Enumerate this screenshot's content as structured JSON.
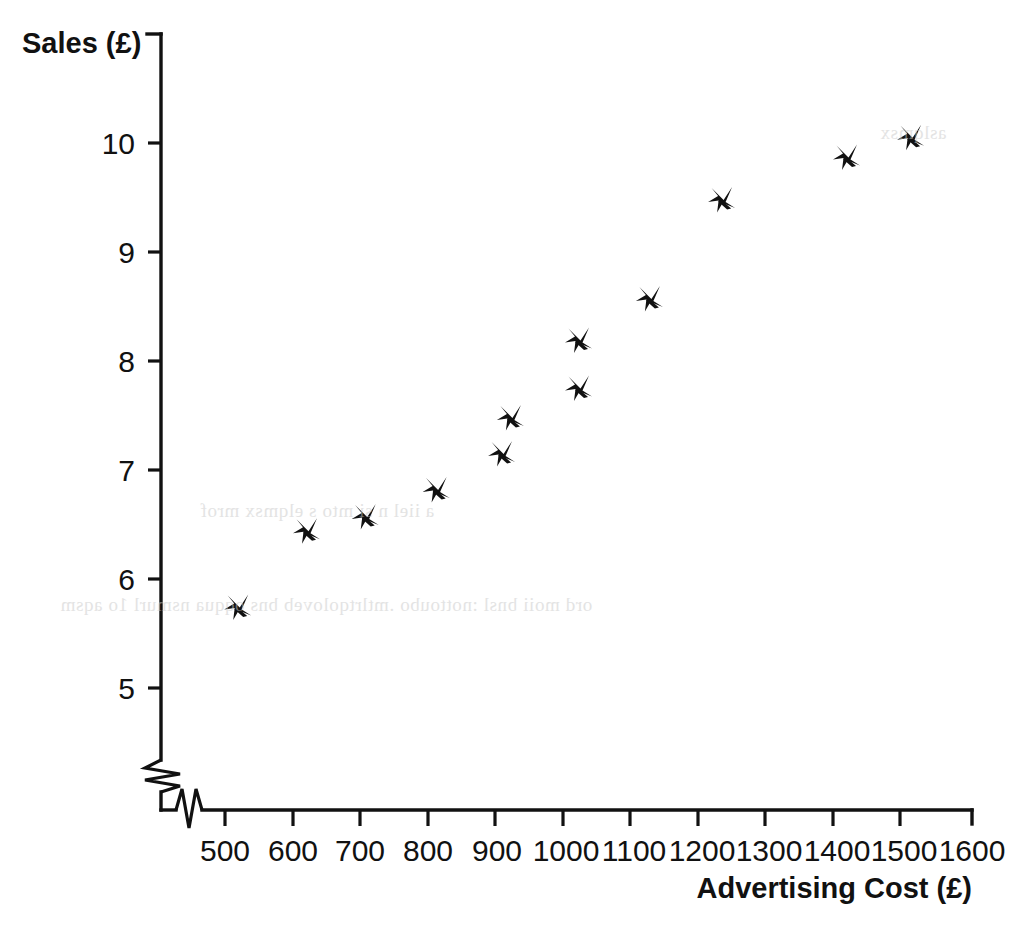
{
  "chart_data": {
    "type": "scatter",
    "title": "",
    "xlabel": "Advertising Cost (£)",
    "ylabel": "Sales (£)",
    "xlim": [
      450,
      1600
    ],
    "ylim": [
      4.6,
      10.6
    ],
    "xticks": [
      500,
      600,
      700,
      800,
      900,
      1000,
      1100,
      1200,
      1300,
      1400,
      1500,
      1600
    ],
    "yticks": [
      5,
      6,
      7,
      8,
      9,
      10
    ],
    "xtick_labels": [
      "500",
      "600",
      "700",
      "800",
      "900",
      "1000",
      "1100",
      "1200",
      "1300",
      "1400",
      "1500",
      "1600"
    ],
    "ytick_labels": [
      "5",
      "6",
      "7",
      "8",
      "9",
      "10"
    ],
    "grid": false,
    "legend": null,
    "axis_break_x": true,
    "axis_break_y": true,
    "marker_style": "cross",
    "marker_color": "#111111",
    "points": [
      {
        "x": 518,
        "y": 5.77
      },
      {
        "x": 620,
        "y": 6.47
      },
      {
        "x": 707,
        "y": 6.6
      },
      {
        "x": 812,
        "y": 6.85
      },
      {
        "x": 909,
        "y": 7.18
      },
      {
        "x": 922,
        "y": 7.51
      },
      {
        "x": 1023,
        "y": 7.78
      },
      {
        "x": 1023,
        "y": 8.22
      },
      {
        "x": 1128,
        "y": 8.6
      },
      {
        "x": 1235,
        "y": 9.51
      },
      {
        "x": 1420,
        "y": 9.9
      },
      {
        "x": 1515,
        "y": 10.08
      }
    ]
  },
  "axes": {
    "y_title": "Sales (£)",
    "x_title": "Advertising Cost (£)"
  },
  "colors": {
    "ink": "#111111",
    "background": "#ffffff",
    "showthrough": "#c9c9c9"
  },
  "artifacts": {
    "scan_showthrough_note": "faint mirrored bleed-through text from reverse page"
  }
}
